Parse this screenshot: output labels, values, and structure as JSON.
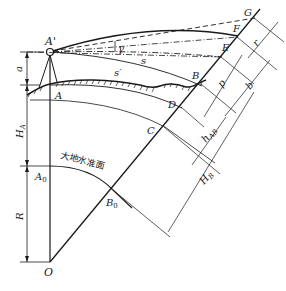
{
  "figure": {
    "type": "surveying-diagram",
    "description_visible": "Trigonometric leveling with earth curvature and refraction",
    "points": {
      "A_prime": "A'",
      "A": "A",
      "A0": "A",
      "A0_sub": "0",
      "B": "B",
      "B0": "B",
      "B0_sub": "0",
      "C": "C",
      "D": "D",
      "E": "E",
      "F": "F",
      "G": "G",
      "O": "O"
    },
    "labels": {
      "gamma": "γ",
      "s": "s",
      "s_prime": "s′",
      "a": "a",
      "H_A": "H",
      "H_A_sub": "A",
      "R": "R",
      "p": "p",
      "r": "r",
      "b": "b",
      "h_AB": "h",
      "h_AB_sub": "AB",
      "H_B": "H",
      "H_B_sub": "B"
    },
    "datum_surface_label": "大地水准面",
    "colors": {
      "line": "#1a1a1a",
      "background": "#ffffff"
    }
  }
}
